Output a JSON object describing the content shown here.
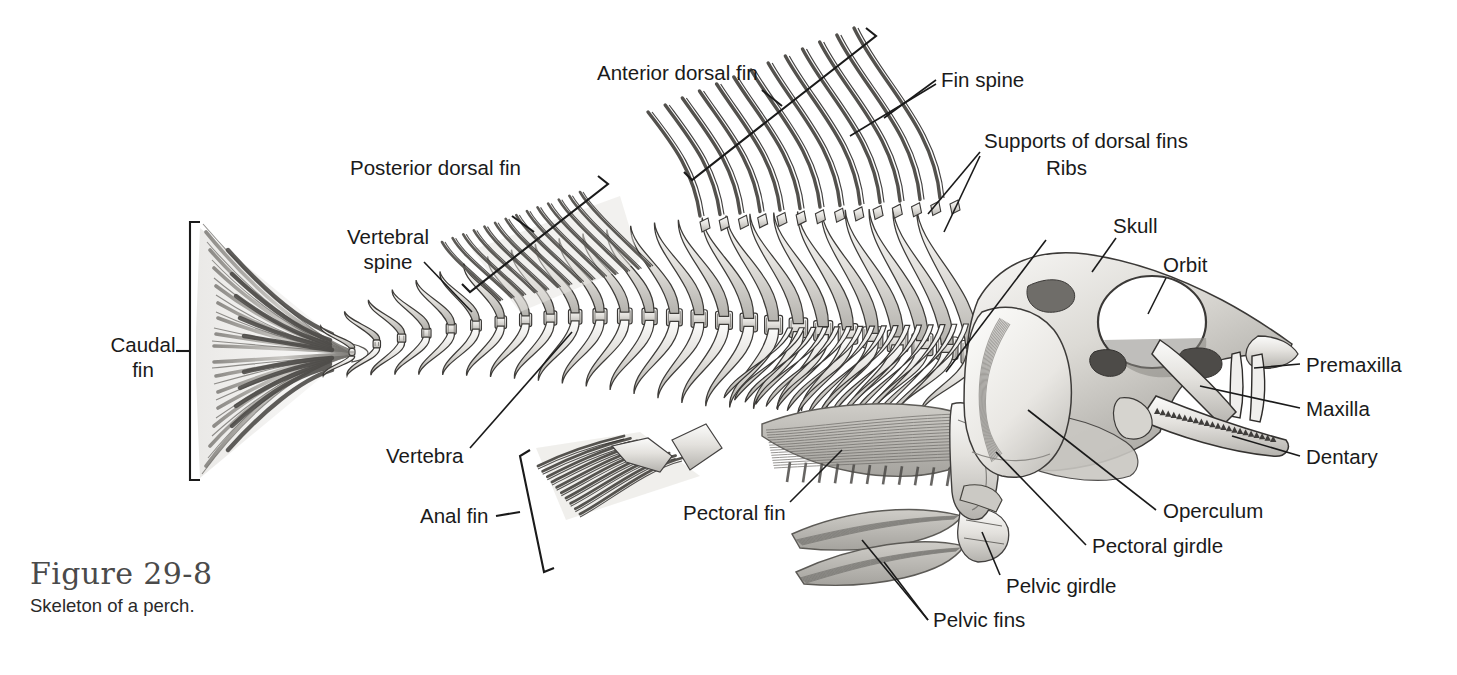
{
  "figure": {
    "number": "Figure 29-8",
    "caption": "Skeleton of a perch.",
    "background_color": "#ffffff",
    "line_color": "#1a1a1a",
    "text_color": "#1a1a1a",
    "bone_light": "#f2f1ef",
    "bone_mid": "#cfcdc9",
    "bone_dark": "#8d8b87"
  },
  "labels": [
    {
      "id": "anterior-dorsal-fin",
      "text": "Anterior dorsal fin",
      "line1": "Anterior dorsal fin",
      "line2": ""
    },
    {
      "id": "fin-spine",
      "text": "Fin spine",
      "line1": "Fin spine",
      "line2": ""
    },
    {
      "id": "supports-of-dorsal-fins",
      "text": "Supports of dorsal fins",
      "line1": "Supports of dorsal fins",
      "line2": ""
    },
    {
      "id": "ribs",
      "text": "Ribs",
      "line1": "Ribs",
      "line2": ""
    },
    {
      "id": "skull",
      "text": "Skull",
      "line1": "Skull",
      "line2": ""
    },
    {
      "id": "orbit",
      "text": "Orbit",
      "line1": "Orbit",
      "line2": ""
    },
    {
      "id": "premaxilla",
      "text": "Premaxilla",
      "line1": "Premaxilla",
      "line2": ""
    },
    {
      "id": "maxilla",
      "text": "Maxilla",
      "line1": "Maxilla",
      "line2": ""
    },
    {
      "id": "dentary",
      "text": "Dentary",
      "line1": "Dentary",
      "line2": ""
    },
    {
      "id": "operculum",
      "text": "Operculum",
      "line1": "Operculum",
      "line2": ""
    },
    {
      "id": "pectoral-girdle",
      "text": "Pectoral girdle",
      "line1": "Pectoral girdle",
      "line2": ""
    },
    {
      "id": "pelvic-girdle",
      "text": "Pelvic girdle",
      "line1": "Pelvic girdle",
      "line2": ""
    },
    {
      "id": "pelvic-fins",
      "text": "Pelvic fins",
      "line1": "Pelvic fins",
      "line2": ""
    },
    {
      "id": "pectoral-fin",
      "text": "Pectoral fin",
      "line1": "Pectoral fin",
      "line2": ""
    },
    {
      "id": "anal-fin",
      "text": "Anal fin",
      "line1": "Anal fin",
      "line2": ""
    },
    {
      "id": "vertebra",
      "text": "Vertebra",
      "line1": "Vertebra",
      "line2": ""
    },
    {
      "id": "vertebral-spine",
      "text": "Vertebral spine",
      "line1": "Vertebral",
      "line2": "spine"
    },
    {
      "id": "caudal-fin",
      "text": "Caudal fin",
      "line1": "Caudal",
      "line2": "fin"
    },
    {
      "id": "posterior-dorsal-fin",
      "text": "Posterior dorsal fin",
      "line1": "Posterior dorsal fin",
      "line2": ""
    }
  ],
  "label_text": {
    "anterior_dorsal_fin": "Anterior dorsal fin",
    "fin_spine": "Fin spine",
    "supports_of_dorsal_fins": "Supports of dorsal fins",
    "ribs": "Ribs",
    "skull": "Skull",
    "orbit": "Orbit",
    "premaxilla": "Premaxilla",
    "maxilla": "Maxilla",
    "dentary": "Dentary",
    "operculum": "Operculum",
    "pectoral_girdle": "Pectoral girdle",
    "pelvic_girdle": "Pelvic girdle",
    "pelvic_fins": "Pelvic fins",
    "pectoral_fin": "Pectoral fin",
    "anal_fin": "Anal fin",
    "vertebra": "Vertebra",
    "vertebral_spine_l1": "Vertebral",
    "vertebral_spine_l2": "spine",
    "caudal_fin_l1": "Caudal",
    "caudal_fin_l2": "fin",
    "posterior_dorsal_fin": "Posterior dorsal fin"
  },
  "structures": [
    {
      "name": "caudal-fin",
      "kind": "fin",
      "rays": 22
    },
    {
      "name": "vertebral-column",
      "kind": "axial",
      "vertebrae": 26
    },
    {
      "name": "posterior-dorsal-fin",
      "kind": "fin",
      "rays": 14
    },
    {
      "name": "anterior-dorsal-fin",
      "kind": "fin",
      "spines": 13
    },
    {
      "name": "anal-fin",
      "kind": "fin",
      "rays": 10
    },
    {
      "name": "rib-cage",
      "kind": "ribs",
      "ribs": 16
    },
    {
      "name": "pectoral-fin",
      "kind": "fin",
      "rays": 14
    },
    {
      "name": "pelvic-fins",
      "kind": "fin",
      "count": 2
    },
    {
      "name": "skull",
      "kind": "cranium"
    },
    {
      "name": "operculum",
      "kind": "plate"
    },
    {
      "name": "jaw",
      "kind": "jaw",
      "teeth": 22
    }
  ]
}
